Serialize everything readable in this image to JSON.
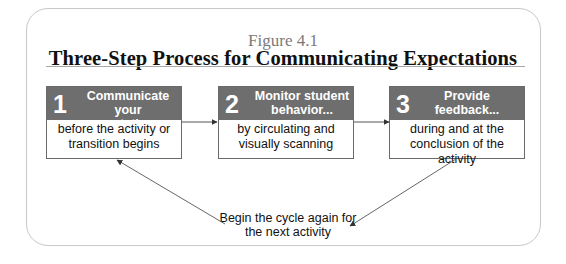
{
  "figure": {
    "label": "Figure 4.1",
    "title": "Three-Step Process for Communicating Expectations"
  },
  "steps": [
    {
      "number": "1",
      "title": "Communicate your expectations...",
      "body": "before the activity or transition begins"
    },
    {
      "number": "2",
      "title": "Monitor student behavior...",
      "body": "by circulating and visually scanning"
    },
    {
      "number": "3",
      "title": "Provide feedback...",
      "body": "during and at the conclusion of the activity"
    }
  ],
  "cycle_note": "Begin the cycle again for the next activity",
  "colors": {
    "header_fill": "#6e6e6e",
    "header_text": "#ffffff",
    "border": "#6a6a6a",
    "figure_label": "#7a7a7a",
    "arrow": "#555555"
  }
}
